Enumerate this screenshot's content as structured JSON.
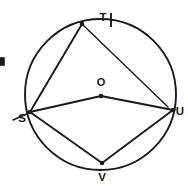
{
  "figure": {
    "background_color": "#ffffff",
    "stroke_color": "#1a1a1a",
    "circle": {
      "center_label": "O",
      "center_x": 100.5,
      "center_y": 94.5,
      "radius": 75.5
    },
    "center_point": {
      "label": "O",
      "label_x": 101,
      "label_y": 86,
      "dot_x": 101,
      "dot_y": 96
    },
    "vertices": [
      {
        "id": "T",
        "label": "T",
        "x": 82,
        "y": 24,
        "label_x": 103,
        "label_y": 21
      },
      {
        "id": "S",
        "label": "S",
        "x": 30,
        "y": 112,
        "label_x": 22,
        "label_y": 122
      },
      {
        "id": "U",
        "label": "U",
        "x": 173,
        "y": 110,
        "label_x": 178,
        "label_y": 114
      },
      {
        "id": "V",
        "label": "V",
        "x": 102,
        "y": 163,
        "label_x": 102,
        "label_y": 180
      }
    ],
    "segments": [
      {
        "name": "chord-T-S",
        "from": "T",
        "to": "S"
      },
      {
        "name": "chord-T-U",
        "from": "T",
        "to": "U"
      },
      {
        "name": "radius-O-S",
        "from": "O",
        "to": "S"
      },
      {
        "name": "radius-O-U",
        "from": "O",
        "to": "U"
      },
      {
        "name": "chord-S-V",
        "from": "S",
        "to": "V"
      },
      {
        "name": "chord-V-U",
        "from": "V",
        "to": "U"
      }
    ],
    "extension": {
      "name": "secant-extension-beyond-S",
      "x1": 30,
      "y1": 112,
      "x2": 13,
      "y2": 120
    },
    "tick_mark": {
      "name": "tick-mark-near-T",
      "x": 111,
      "y1": 13,
      "y2": 27
    },
    "edge_fragment": {
      "name": "cropped-mark-left-edge",
      "x": 1,
      "y": 58,
      "width": 4,
      "height": 7
    }
  }
}
